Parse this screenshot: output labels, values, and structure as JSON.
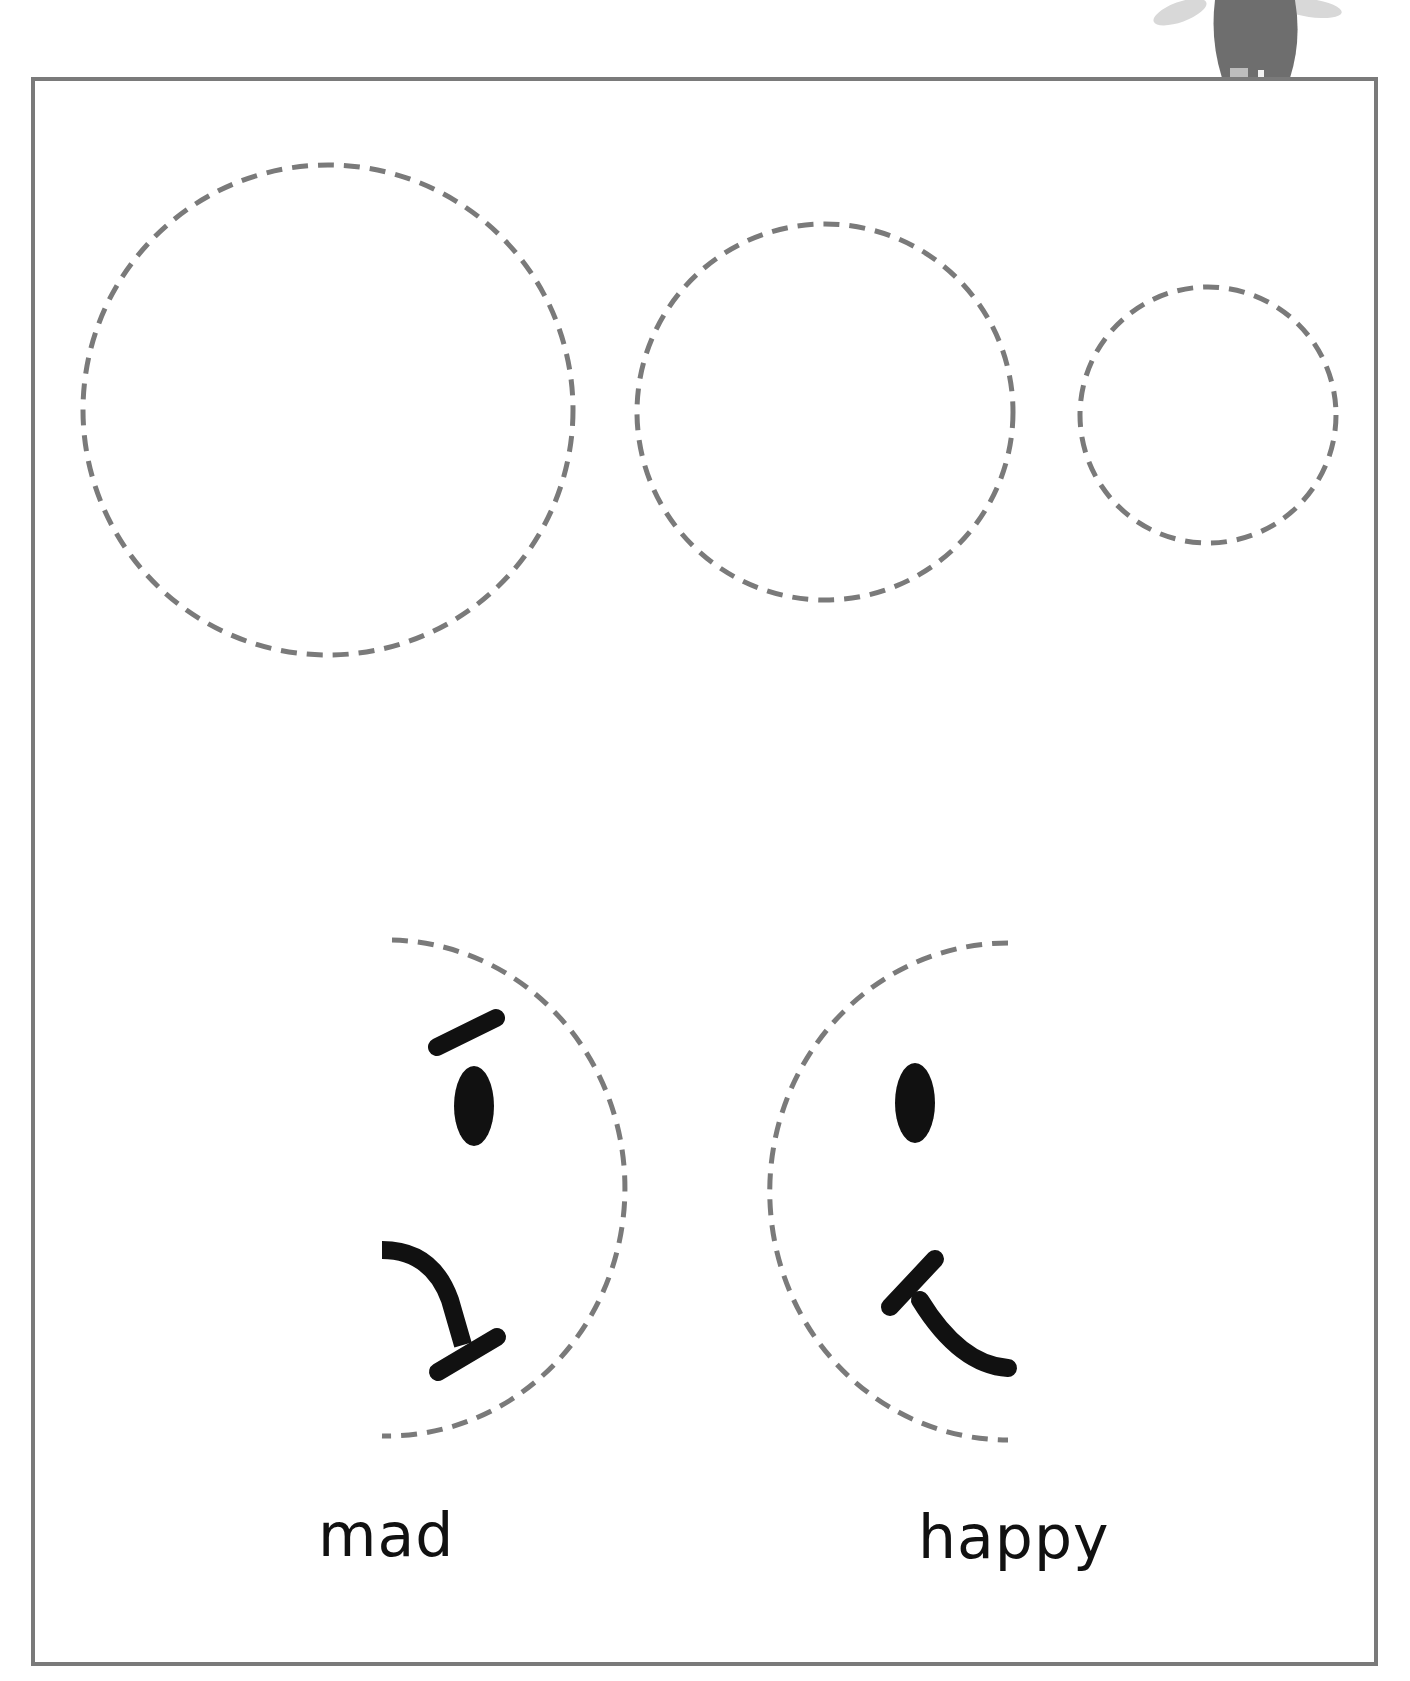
{
  "worksheet": {
    "title": "Tracing circles and faces",
    "circles": [
      {
        "cx": 328,
        "cy": 410,
        "r": 245
      },
      {
        "cx": 825,
        "cy": 412,
        "r": 188
      },
      {
        "cx": 1208,
        "cy": 415,
        "r": 128
      }
    ],
    "faces": [
      {
        "label": "mad",
        "emotion": "mad"
      },
      {
        "label": "happy",
        "emotion": "happy"
      }
    ],
    "colors": {
      "dash": "#7a7a7a",
      "ink": "#111111",
      "frame": "#7a7a7a"
    }
  }
}
